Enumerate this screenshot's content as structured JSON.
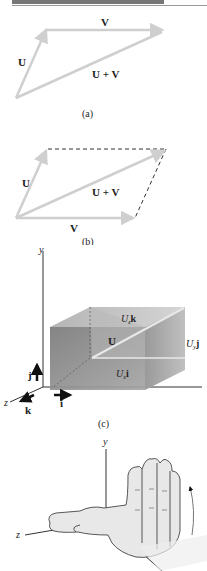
{
  "figure_a": {
    "vectors": {
      "V": "V",
      "U": "U",
      "sum": "U + V"
    },
    "caption": "(a)"
  },
  "figure_b": {
    "vectors": {
      "U": "U",
      "V": "V",
      "sum": "U + V"
    },
    "caption": "(b)"
  },
  "figure_c": {
    "axes": {
      "y": "y",
      "z": "z"
    },
    "unit_vectors": {
      "i": "i",
      "j": "j",
      "k": "k"
    },
    "components": {
      "x": "U",
      "x_sub": "x",
      "x_unit": "i",
      "y": "U",
      "y_sub": "y",
      "y_unit": "j",
      "z": "U",
      "z_sub": "z",
      "z_unit": "k"
    },
    "vector": "U",
    "caption": "(c)"
  },
  "figure_d": {
    "axes": {
      "y": "y",
      "z": "z"
    }
  },
  "colors": {
    "arrow": "#cfcfcf",
    "box_dark": "#8a8a8a",
    "box_light": "#c8c8c8",
    "topbar": "#777777"
  }
}
